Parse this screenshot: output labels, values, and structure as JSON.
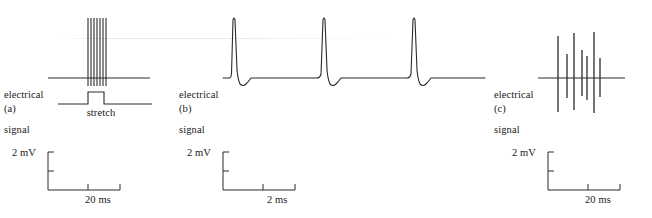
{
  "figure": {
    "background": "#ffffff",
    "ink": "#1a1a1a",
    "trace_color": "#2b2b2b"
  },
  "panels": [
    {
      "id": "a",
      "letter": "(a)",
      "signal_label_line1": "electrical",
      "signal_label_line2": "signal",
      "stimulus_label": "stretch",
      "trace_type": "spike-burst",
      "baseline_y": 78,
      "spike_count": 7,
      "spike_positions": [
        88,
        91,
        94,
        97,
        100,
        103,
        106
      ],
      "spike_top_y": 18,
      "spike_bottom_y": 86,
      "axis_x_start": 48,
      "axis_x_end": 150,
      "stimulus": {
        "baseline_y": 104,
        "pulse_top_y": 92,
        "x_start": 58,
        "rise_x": 88,
        "fall_x": 104,
        "x_end": 152
      },
      "scale_bar": {
        "y_label": "2 mV",
        "x_label": "20 ms",
        "origin_x": 48,
        "origin_y": 190,
        "top_y": 152,
        "right_x": 120,
        "y_ticks": [
          152,
          171
        ],
        "x_ticks": [
          88,
          120
        ]
      }
    },
    {
      "id": "b",
      "letter": "(b)",
      "signal_label_line1": "electrical",
      "signal_label_line2": "signal",
      "stimulus_label": "",
      "trace_type": "action-potentials",
      "baseline_y": 78,
      "spike_count": 3,
      "spike_peak_times": [
        59,
        149,
        239
      ],
      "spike_peak_y": 16,
      "undershoot_y": 84,
      "axis_x_start": 48,
      "axis_x_end": 310,
      "scale_bar": {
        "y_label": "2 mV",
        "x_label": "2 ms",
        "origin_x": 48,
        "origin_y": 190,
        "top_y": 152,
        "right_x": 120,
        "y_ticks": [
          152,
          171
        ],
        "x_ticks": [
          88,
          120
        ]
      }
    },
    {
      "id": "c",
      "letter": "(c)",
      "signal_label_line1": "electrical",
      "signal_label_line2": "signal",
      "stimulus_label": "",
      "trace_type": "discrete-spikes",
      "baseline_y": 78,
      "spike_count": 7,
      "spikes": [
        {
          "x": 68,
          "top_y": 36,
          "bottom_y": 112
        },
        {
          "x": 77,
          "top_y": 54,
          "bottom_y": 98
        },
        {
          "x": 84,
          "top_y": 33,
          "bottom_y": 110
        },
        {
          "x": 92,
          "top_y": 50,
          "bottom_y": 96
        },
        {
          "x": 97,
          "top_y": 56,
          "bottom_y": 100
        },
        {
          "x": 104,
          "top_y": 32,
          "bottom_y": 113
        },
        {
          "x": 110,
          "top_y": 58,
          "bottom_y": 97
        }
      ],
      "axis_x_start": 48,
      "axis_x_end": 135,
      "scale_bar": {
        "y_label": "2 mV",
        "x_label": "20 ms",
        "origin_x": 58,
        "origin_y": 190,
        "top_y": 152,
        "right_x": 130,
        "y_ticks": [
          152,
          171
        ],
        "x_ticks": [
          98,
          130
        ]
      }
    }
  ]
}
